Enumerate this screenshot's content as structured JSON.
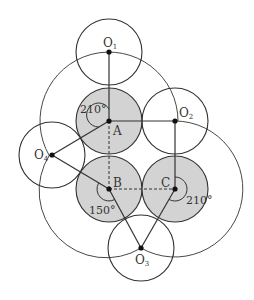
{
  "figure": {
    "colors": {
      "stroke": "#333333",
      "fill_shaded": "#d3d3d3",
      "background": "#ffffff"
    },
    "small_circle_radius": 33,
    "points": {
      "A": {
        "label": "A",
        "x": 109,
        "y": 121,
        "shaded": true
      },
      "B": {
        "label": "B",
        "x": 109,
        "y": 189,
        "shaded": true
      },
      "C": {
        "label": "C",
        "x": 175,
        "y": 189,
        "shaded": true
      },
      "O1": {
        "label": "O",
        "sub": "1",
        "x": 109,
        "y": 52
      },
      "O2": {
        "label": "O",
        "sub": "2",
        "x": 175,
        "y": 121
      },
      "O3": {
        "label": "O",
        "sub": "3",
        "x": 141,
        "y": 248
      },
      "O4": {
        "label": "O",
        "sub": "4",
        "x": 52,
        "y": 155
      }
    },
    "angles": {
      "A": "210°",
      "B": "150°",
      "C": "210°"
    }
  }
}
